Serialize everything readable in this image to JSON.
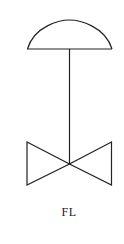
{
  "diagram": {
    "type": "valve-symbol",
    "symbol_name": "diaphragm-actuated valve",
    "label": "FL",
    "colors": {
      "stroke": "#222222",
      "background": "#ffffff"
    },
    "elements": [
      {
        "name": "diaphragm-actuator",
        "shape": "semicircle-dome"
      },
      {
        "name": "valve-stem",
        "shape": "vertical-line"
      },
      {
        "name": "valve-body",
        "shape": "bowtie-two-triangles"
      }
    ]
  }
}
